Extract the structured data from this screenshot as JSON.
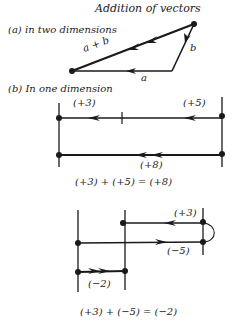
{
  "title": "Addition of vectors",
  "part_a": {
    "label": "(a) in two dimensions",
    "vec_a": "a",
    "vec_b": "b",
    "vec_sum": "a + b"
  },
  "part_b": {
    "label": "(b) In one dimension",
    "example1": {
      "first": "(+3)",
      "second": "(+5)",
      "result": "(+8)",
      "equation": "(+3) + (+5) = (+8)"
    },
    "example2": {
      "first": "(+3)",
      "second": "(−5)",
      "result": "(−2)",
      "equation": "(+3) + (−5) = (−2)"
    }
  },
  "colors": {
    "ink": "#1a1a1a",
    "background": "#ffffff"
  }
}
